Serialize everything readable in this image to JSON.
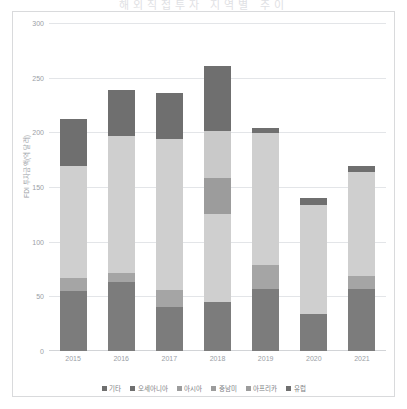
{
  "page": {
    "cut_title": "해외직접투자 지역별 추이"
  },
  "chart_data": {
    "type": "bar",
    "stacked": true,
    "title": "",
    "xlabel": "",
    "ylabel": "FDI 투자금액(억 달러)",
    "categories": [
      "2015",
      "2016",
      "2017",
      "2018",
      "2019",
      "2020",
      "2021"
    ],
    "ylim": [
      0,
      300
    ],
    "yticks": [
      0,
      50,
      100,
      150,
      200,
      250,
      300
    ],
    "grid": true,
    "legend_position": "bottom",
    "series": [
      {
        "name": "유럽",
        "color": "#7c7c7c",
        "values": [
          55,
          63,
          40,
          45,
          57,
          34,
          57
        ]
      },
      {
        "name": "아프리카",
        "color": "#a5a5a5",
        "values": [
          12,
          8,
          16,
          0,
          22,
          0,
          12
        ]
      },
      {
        "name": "중남미",
        "color": "#cfcfcf",
        "values": [
          102,
          126,
          138,
          80,
          120,
          100,
          95
        ]
      },
      {
        "name": "아시아",
        "color": "#9c9c9c",
        "values": [
          0,
          0,
          0,
          33,
          0,
          0,
          0
        ]
      },
      {
        "name": "오세아니아",
        "color": "#c9c9c9",
        "values": [
          0,
          0,
          0,
          43,
          0,
          0,
          0
        ]
      },
      {
        "name": "기타",
        "color": "#6f6f6f",
        "values": [
          43,
          42,
          42,
          60,
          5,
          6,
          5
        ]
      }
    ],
    "totals": [
      212,
      239,
      236,
      261,
      204,
      140,
      169
    ]
  },
  "legend": {
    "items": [
      {
        "label": "기타",
        "color": "#6f6f6f"
      },
      {
        "label": "오세아니아",
        "color": "#6f6f6f"
      },
      {
        "label": "아시아",
        "color": "#9c9c9c"
      },
      {
        "label": "중남미",
        "color": "#9c9c9c"
      },
      {
        "label": "아프리카",
        "color": "#9c9c9c"
      },
      {
        "label": "유럽",
        "color": "#6f6f6f"
      }
    ]
  }
}
